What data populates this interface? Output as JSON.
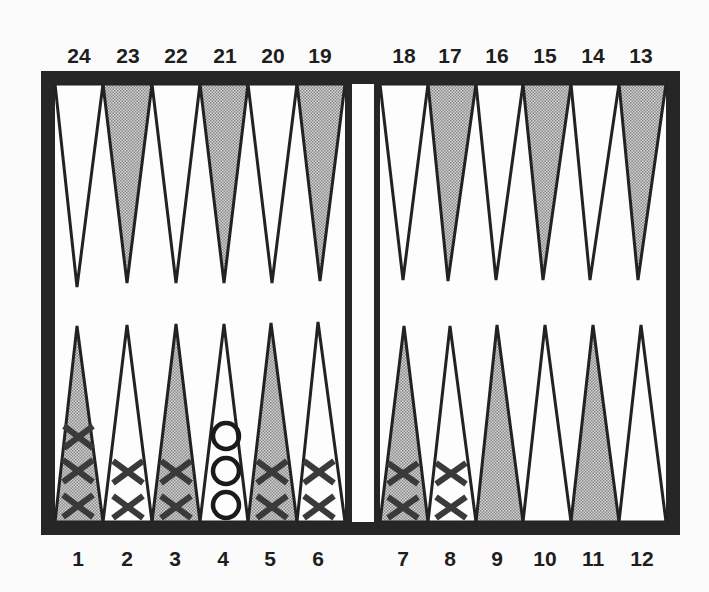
{
  "diagram": {
    "type": "backgammon-board",
    "colors": {
      "frame": "#262626",
      "board_bg": "#fdfdfd",
      "shaded_point": "#a8a8a8",
      "point_outline": "#222222",
      "checker_x": "#3a3a3a",
      "checker_o": "#1a1a1a"
    },
    "top_labels": [
      "24",
      "23",
      "22",
      "21",
      "20",
      "19",
      "18",
      "17",
      "16",
      "15",
      "14",
      "13"
    ],
    "bottom_labels": [
      "1",
      "2",
      "3",
      "4",
      "5",
      "6",
      "7",
      "8",
      "9",
      "10",
      "11",
      "12"
    ],
    "shaded_points": [
      1,
      3,
      5,
      7,
      9,
      11,
      13,
      15,
      17,
      19,
      21,
      23
    ],
    "checkers": [
      {
        "point": 1,
        "symbol": "X",
        "count": 3
      },
      {
        "point": 2,
        "symbol": "X",
        "count": 2
      },
      {
        "point": 3,
        "symbol": "X",
        "count": 2
      },
      {
        "point": 4,
        "symbol": "O",
        "count": 3
      },
      {
        "point": 5,
        "symbol": "X",
        "count": 2
      },
      {
        "point": 6,
        "symbol": "X",
        "count": 2
      },
      {
        "point": 7,
        "symbol": "X",
        "count": 2
      },
      {
        "point": 8,
        "symbol": "X",
        "count": 2
      }
    ]
  }
}
